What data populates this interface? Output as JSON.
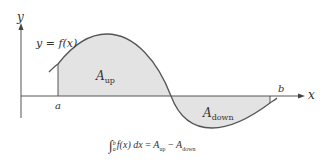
{
  "diagram": {
    "type": "definite-integral-signed-area",
    "axes": {
      "x_label": "x",
      "y_label": "y"
    },
    "curve_label": "y = f(x)",
    "bounds": {
      "lower": "a",
      "upper": "b"
    },
    "regions": [
      {
        "name": "A",
        "subscript": "up",
        "position": "above x-axis"
      },
      {
        "name": "A",
        "subscript": "down",
        "position": "below x-axis"
      }
    ],
    "formula": {
      "integral_lower": "a",
      "integral_upper": "b",
      "integrand": "f(x) dx",
      "equals": "=",
      "term1": "A",
      "term1_sub": "up",
      "minus": "−",
      "term2": "A",
      "term2_sub": "down"
    },
    "colors": {
      "fill": "#e3e3e3",
      "stroke": "#555555",
      "axis": "#555555",
      "text": "#333333"
    }
  }
}
